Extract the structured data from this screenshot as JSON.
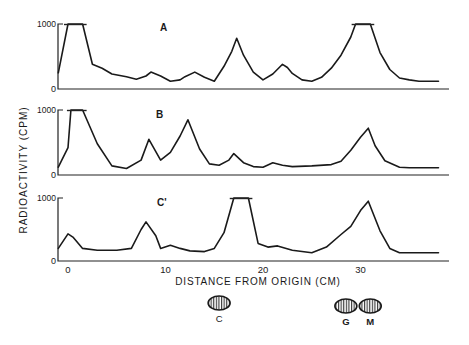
{
  "figure": {
    "ylabel": "RADIOACTIVITY (CPM)",
    "xlabel": "DISTANCE FROM ORIGIN (CM)",
    "x_ticks": [
      "0",
      "10",
      "20",
      "30"
    ],
    "markers": [
      {
        "label": "C",
        "position_cm": 15.5
      },
      {
        "label": "G",
        "position_cm": 28.5
      },
      {
        "label": "M",
        "position_cm": 31.0
      }
    ]
  },
  "chart_data": [
    {
      "type": "line",
      "title": "A",
      "xlabel": "DISTANCE FROM ORIGIN (CM)",
      "ylabel": "RADIOACTIVITY (CPM)",
      "y_ticks": [
        "0",
        "1000"
      ],
      "ylim": [
        0,
        1000
      ],
      "xlim": [
        -1,
        39
      ],
      "clipped_at": 1000,
      "x": [
        -1,
        0,
        0.5,
        1.5,
        2.5,
        3.5,
        4.5,
        6,
        7,
        8,
        8.5,
        9.5,
        10.5,
        11.5,
        12,
        13,
        14,
        15,
        16,
        16.8,
        17.3,
        18,
        19,
        20,
        21,
        22,
        22.5,
        23,
        24,
        25,
        26,
        27,
        28,
        29,
        29.5,
        30,
        31,
        32,
        33,
        34,
        35,
        36,
        37,
        38
      ],
      "values": [
        250,
        1000,
        1000,
        1000,
        380,
        320,
        230,
        190,
        150,
        200,
        260,
        200,
        120,
        140,
        190,
        260,
        180,
        120,
        350,
        580,
        780,
        520,
        260,
        140,
        230,
        380,
        330,
        240,
        140,
        120,
        180,
        320,
        520,
        800,
        1000,
        1000,
        1000,
        560,
        300,
        170,
        140,
        120,
        120,
        120
      ]
    },
    {
      "type": "line",
      "title": "B",
      "xlabel": "DISTANCE FROM ORIGIN (CM)",
      "ylabel": "RADIOACTIVITY (CPM)",
      "y_ticks": [
        "0",
        "1000"
      ],
      "ylim": [
        0,
        1000
      ],
      "xlim": [
        -1,
        39
      ],
      "clipped_at": 1000,
      "x": [
        -1,
        0,
        0.3,
        1.5,
        3,
        4.5,
        6,
        7.5,
        8.3,
        9.5,
        10.5,
        11.5,
        12.3,
        13.5,
        14.5,
        15.5,
        16.5,
        17,
        18,
        19,
        20,
        21,
        22,
        23,
        25,
        27,
        28,
        29,
        30,
        30.8,
        31.5,
        32.5,
        34,
        35,
        36,
        37,
        38
      ],
      "values": [
        120,
        420,
        1000,
        1000,
        480,
        140,
        100,
        230,
        550,
        230,
        350,
        600,
        850,
        400,
        170,
        150,
        230,
        330,
        190,
        130,
        120,
        190,
        150,
        130,
        140,
        160,
        210,
        380,
        580,
        720,
        450,
        220,
        120,
        110,
        110,
        110,
        110
      ]
    },
    {
      "type": "line",
      "title": "C'",
      "xlabel": "DISTANCE FROM ORIGIN (CM)",
      "ylabel": "RADIOACTIVITY (CPM)",
      "y_ticks": [
        "0",
        "1000"
      ],
      "ylim": [
        0,
        1000
      ],
      "xlim": [
        -1,
        39
      ],
      "clipped_at": 1000,
      "x": [
        -1,
        0,
        0.5,
        1.5,
        3,
        5,
        6.5,
        7.5,
        8,
        9,
        9.5,
        10.5,
        11.5,
        12.5,
        14,
        15,
        16,
        17,
        17.5,
        18.5,
        19.5,
        20.5,
        21.5,
        23,
        25,
        26.5,
        28,
        29,
        30,
        30.8,
        32,
        33,
        34,
        36,
        38
      ],
      "values": [
        200,
        430,
        380,
        200,
        170,
        170,
        200,
        500,
        620,
        400,
        200,
        250,
        200,
        160,
        150,
        200,
        450,
        1000,
        1000,
        1000,
        280,
        220,
        240,
        170,
        130,
        220,
        420,
        550,
        800,
        950,
        480,
        200,
        130,
        130,
        130
      ]
    }
  ]
}
